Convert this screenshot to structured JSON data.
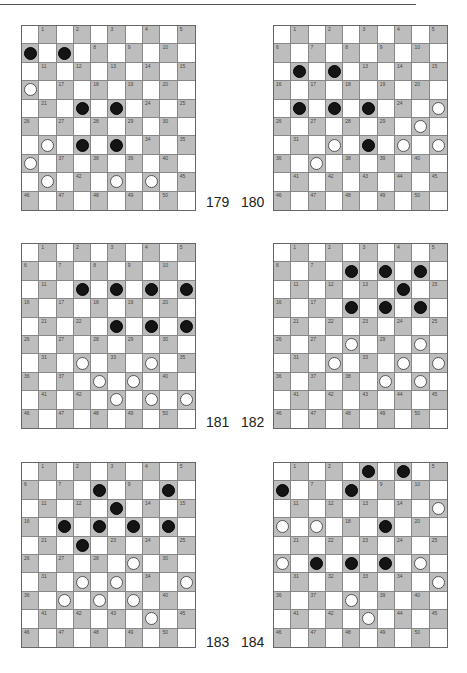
{
  "colors": {
    "dark_square": "#bdbdbd",
    "light_square": "#ffffff",
    "black_piece": "#141414",
    "white_piece": "#ffffff"
  },
  "diagrams": [
    {
      "number": "179",
      "black": [
        6,
        7,
        22,
        23,
        32,
        33
      ],
      "white": [
        16,
        31,
        36,
        41,
        43,
        44
      ]
    },
    {
      "number": "180",
      "black": [
        11,
        12,
        21,
        22,
        23,
        33
      ],
      "white": [
        25,
        30,
        32,
        34,
        35,
        37
      ]
    },
    {
      "number": "181",
      "black": [
        12,
        13,
        14,
        15,
        23,
        24,
        25
      ],
      "white": [
        32,
        34,
        38,
        39,
        43,
        44,
        45
      ]
    },
    {
      "number": "182",
      "black": [
        8,
        9,
        10,
        14,
        18,
        19,
        20
      ],
      "white": [
        28,
        30,
        32,
        34,
        35,
        39,
        40
      ]
    },
    {
      "number": "183",
      "black": [
        8,
        10,
        13,
        17,
        18,
        19,
        20,
        22
      ],
      "white": [
        29,
        32,
        33,
        35,
        37,
        38,
        39,
        44
      ]
    },
    {
      "number": "184",
      "black": [
        3,
        4,
        6,
        8,
        19,
        27,
        28,
        29
      ],
      "white": [
        15,
        16,
        17,
        26,
        30,
        35,
        38,
        43
      ]
    }
  ]
}
